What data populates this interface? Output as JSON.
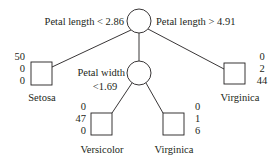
{
  "root": {
    "left_condition": "Petal length < 2.86",
    "right_condition": "Petal length > 4.91"
  },
  "inner": {
    "condition_line1": "Petal width",
    "condition_line2": "<1.69"
  },
  "leaves": [
    {
      "label": "Setosa",
      "counts": [
        "50",
        "0",
        "0"
      ]
    },
    {
      "label": "Versicolor",
      "counts": [
        "0",
        "47",
        "0"
      ]
    },
    {
      "label": "Virginica",
      "counts": [
        "0",
        "1",
        "6"
      ]
    },
    {
      "label": "Virginica",
      "counts": [
        "0",
        "2",
        "44"
      ]
    }
  ]
}
